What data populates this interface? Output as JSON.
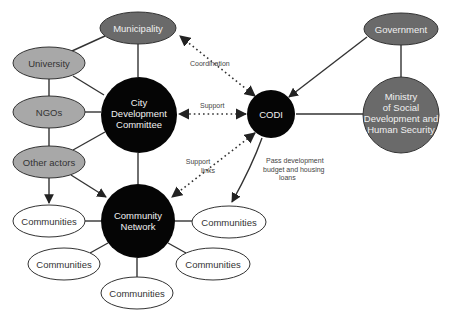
{
  "colors": {
    "background": "#ffffff",
    "black_node": "#050505",
    "dark_gray_node": "#6a6a6a",
    "light_gray_node": "#a8a8a8",
    "white_node": "#ffffff",
    "line": "#333333"
  },
  "nodes": {
    "municipality": {
      "label": "Municipality",
      "shape": "ellipse",
      "fill": "dark-gray"
    },
    "university": {
      "label": "University",
      "shape": "ellipse",
      "fill": "light-gray"
    },
    "ngos": {
      "label": "NGOs",
      "shape": "ellipse",
      "fill": "light-gray"
    },
    "other_actors": {
      "label": "Other actors",
      "shape": "ellipse",
      "fill": "light-gray"
    },
    "city_dev_committee": {
      "lines": [
        "City",
        "Development",
        "Committee"
      ],
      "shape": "circle",
      "fill": "black"
    },
    "community_network": {
      "lines": [
        "Community",
        "Network"
      ],
      "shape": "circle",
      "fill": "black"
    },
    "codi": {
      "label": "CODI",
      "shape": "circle",
      "fill": "black"
    },
    "government": {
      "label": "Government",
      "shape": "ellipse",
      "fill": "dark-gray"
    },
    "ministry": {
      "lines": [
        "Ministry",
        "of Social",
        "Development and",
        "Human Security"
      ],
      "shape": "circle",
      "fill": "dark-gray"
    },
    "communities": [
      {
        "label": "Communities"
      },
      {
        "label": "Communities"
      },
      {
        "label": "Communities"
      },
      {
        "label": "Communities"
      },
      {
        "label": "Communities"
      }
    ]
  },
  "edge_labels": {
    "coordination": "Coordination",
    "support": "Support",
    "support_links": [
      "Support",
      "links"
    ],
    "pass_budget": [
      "Pass development",
      "budget and housing",
      "loans"
    ]
  },
  "edges": [
    {
      "from": "Municipality",
      "to": "University",
      "style": "solid"
    },
    {
      "from": "Municipality",
      "to": "City Development Committee",
      "style": "solid"
    },
    {
      "from": "University",
      "to": "NGOs",
      "style": "solid"
    },
    {
      "from": "University",
      "to": "City Development Committee",
      "style": "solid"
    },
    {
      "from": "NGOs",
      "to": "Other actors",
      "style": "solid"
    },
    {
      "from": "NGOs",
      "to": "City Development Committee",
      "style": "solid"
    },
    {
      "from": "Other actors",
      "to": "City Development Committee",
      "style": "solid"
    },
    {
      "from": "Other actors",
      "to": "Communities",
      "style": "arrow"
    },
    {
      "from": "Other actors",
      "to": "Community Network",
      "style": "arrow"
    },
    {
      "from": "City Development Committee",
      "to": "Community Network",
      "style": "solid"
    },
    {
      "from": "CODI",
      "to": "Municipality",
      "style": "dotted-bidirectional",
      "label": "Coordination"
    },
    {
      "from": "CODI",
      "to": "City Development Committee",
      "style": "dotted-bidirectional",
      "label": "Support"
    },
    {
      "from": "CODI",
      "to": "Community Network",
      "style": "dotted-bidirectional",
      "label": "Support links"
    },
    {
      "from": "CODI",
      "to": "Communities",
      "style": "arrow",
      "label": "Pass development budget and housing loans"
    },
    {
      "from": "Government",
      "to": "CODI",
      "style": "arrow"
    },
    {
      "from": "Government",
      "to": "Ministry of Social Development and Human Security",
      "style": "solid"
    },
    {
      "from": "CODI",
      "to": "Ministry of Social Development and Human Security",
      "style": "solid"
    },
    {
      "from": "Community Network",
      "to": "Communities",
      "style": "solid",
      "count": 5
    }
  ]
}
